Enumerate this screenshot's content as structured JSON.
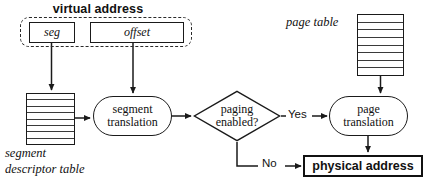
{
  "diagram": {
    "title": "virtual address",
    "nodes": {
      "seg_field": "seg",
      "offset_field": "offset",
      "segment_descriptor_table_label": "segment\ndescriptor table",
      "segment_descriptor_table_label_line1": "segment",
      "segment_descriptor_table_label_line2": "descriptor table",
      "page_table_label": "page table",
      "segment_translation": "segment translation",
      "segment_translation_line1": "segment",
      "segment_translation_line2": "translation",
      "paging_enabled": "paging enabled?",
      "paging_enabled_line1": "paging",
      "paging_enabled_line2": "enabled?",
      "page_translation": "page translation",
      "page_translation_line1": "page",
      "page_translation_line2": "translation",
      "physical_address": "physical address"
    },
    "edge_labels": {
      "yes": "Yes",
      "no": "No"
    },
    "table_rows": {
      "segment_descriptor_table": 8,
      "page_table": 8
    },
    "colors": {
      "stroke": "#1a1a1a",
      "dashed_stroke": "#2a2a2a",
      "text": "#111111",
      "background": "#ffffff"
    }
  }
}
